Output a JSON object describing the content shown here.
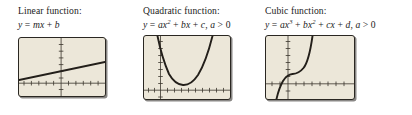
{
  "figure": {
    "background_color": "#ffffff",
    "screen_color": "#ece7d9",
    "ink_color": "#231f1a"
  },
  "panels": [
    {
      "id": "linear",
      "title": "Linear function:",
      "formula_parts": {
        "y": "y",
        "eq": " = ",
        "m": "m",
        "x": "x",
        "plus": " + ",
        "b": "b"
      },
      "formula_plain": "y = mx + b",
      "graph": {
        "type": "line",
        "description": "straight line with positive slope crossing the y-axis above the x-axis",
        "axis_x_position": 0.78,
        "axis_y_position": 0.49,
        "points": [
          [
            0.0,
            0.72
          ],
          [
            1.0,
            0.41
          ]
        ]
      }
    },
    {
      "id": "quadratic",
      "title": "Quadratic function:",
      "formula_parts": {
        "y": "y",
        "eq": " = ",
        "a": "a",
        "x": "x",
        "exp1": "2",
        "plus1": " + ",
        "b": "b",
        "x2": "x",
        "plus2": " + ",
        "c": "c",
        "comma": ", ",
        "a2": "a",
        "gt": " > ",
        "zero": "0"
      },
      "formula_plain": "y = ax² + bx + c, a > 0",
      "graph": {
        "type": "parabola",
        "description": "upward-opening parabola with vertex just above the x-axis, right of the y-axis",
        "axis_x_position": 0.86,
        "axis_y_position": 0.19,
        "vertex": [
          0.45,
          0.78
        ]
      }
    },
    {
      "id": "cubic",
      "title": "Cubic function:",
      "formula_parts": {
        "y": "y",
        "eq": " = ",
        "a": "a",
        "x": "x",
        "exp1": "3",
        "plus1": " + ",
        "b": "b",
        "x2": "x",
        "exp2": "2",
        "plus2": " + ",
        "c": "c",
        "x3": "x",
        "plus3": " + ",
        "d": "d",
        "comma": ", ",
        "a2": "a",
        "gt": " > ",
        "zero": "0"
      },
      "formula_plain": "y = ax³ + bx² + cx + d, a > 0",
      "graph": {
        "type": "cubic",
        "description": "increasing cubic curve with a flat inflection shelf above the x-axis",
        "axis_x_position": 0.76,
        "axis_y_position": 0.25,
        "inflection": [
          0.3,
          0.62
        ]
      }
    }
  ]
}
